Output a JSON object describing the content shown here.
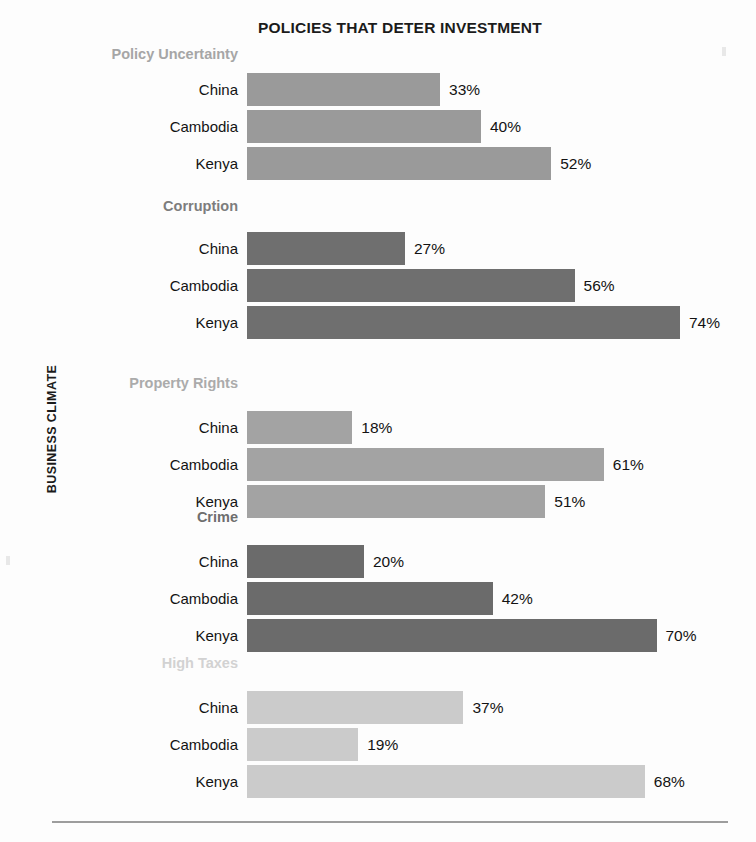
{
  "chart_data": {
    "type": "bar",
    "orientation": "horizontal",
    "title": "POLICIES THAT DETER INVESTMENT",
    "xlabel": "",
    "ylabel": "BUSINESS CLIMATE",
    "xlim": [
      0,
      80
    ],
    "grid": false,
    "legend": "none",
    "value_suffix": "%",
    "categories": [
      "China",
      "Cambodia",
      "Kenya"
    ],
    "groups": [
      {
        "name": "Policy Uncertainty",
        "color": "#9a9a9a",
        "label_color": "#a6a6a6",
        "values": [
          33,
          40,
          52
        ],
        "labels": [
          "33%",
          "40%",
          "52%"
        ]
      },
      {
        "name": "Corruption",
        "color": "#6f6f6f",
        "label_color": "#7d7d7d",
        "values": [
          27,
          56,
          74
        ],
        "labels": [
          "27%",
          "56%",
          "74%"
        ]
      },
      {
        "name": "Property Rights",
        "color": "#a3a3a3",
        "label_color": "#ababab",
        "values": [
          18,
          61,
          51
        ],
        "labels": [
          "18%",
          "61%",
          "51%"
        ]
      },
      {
        "name": "Crime",
        "color": "#6b6b6b",
        "label_color": "#6e6e6e",
        "values": [
          20,
          42,
          70
        ],
        "labels": [
          "20%",
          "42%",
          "70%"
        ]
      },
      {
        "name": "High Taxes",
        "color": "#cbcbcb",
        "label_color": "#d2d2d2",
        "values": [
          37,
          19,
          68
        ],
        "labels": [
          "37%",
          "19%",
          "68%"
        ]
      }
    ]
  },
  "layout": {
    "bar_origin_x": 247,
    "px_per_percent": 5.85,
    "bar_height": 33,
    "row_gap": 4,
    "group_tops": [
      73,
      232,
      411,
      545,
      691
    ],
    "group_label_tops": [
      46,
      198,
      375,
      509,
      655
    ]
  },
  "colors": {
    "page_background": "#fdfdfd",
    "text": "#131313",
    "rule": "#9d9d9d"
  }
}
